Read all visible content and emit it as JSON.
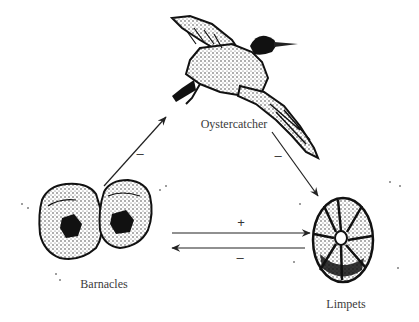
{
  "diagram": {
    "type": "food-web / species interaction",
    "nodes": [
      {
        "id": "oystercatcher",
        "label": "Oystercatcher",
        "icon": "bird-illustration"
      },
      {
        "id": "barnacles",
        "label": "Barnacles",
        "icon": "barnacle-illustration"
      },
      {
        "id": "limpets",
        "label": "Limpets",
        "icon": "limpet-illustration"
      }
    ],
    "edges": [
      {
        "from": "barnacles",
        "to": "oystercatcher",
        "sign": "–"
      },
      {
        "from": "oystercatcher",
        "to": "limpets",
        "sign": "–"
      },
      {
        "from": "barnacles",
        "to": "limpets",
        "sign": "+"
      },
      {
        "from": "limpets",
        "to": "barnacles",
        "sign": "–"
      }
    ],
    "colors": {
      "ink": "#1a1a1a",
      "label": "#3a3a3a",
      "background": "#ffffff"
    }
  }
}
